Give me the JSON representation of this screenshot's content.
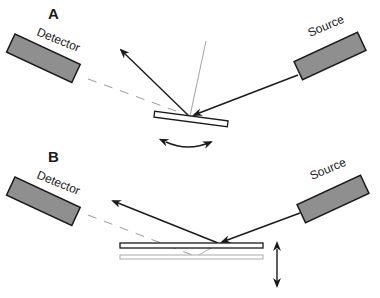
{
  "panels": [
    {
      "id": "A",
      "label": "A",
      "detector_label": "Detector",
      "source_label": "Source",
      "sample_motion": "rotation"
    },
    {
      "id": "B",
      "label": "B",
      "detector_label": "Detector",
      "source_label": "Source",
      "sample_motion": "vertical translation"
    }
  ],
  "colors": {
    "device_fill": "#8f8f8f",
    "stroke": "#1a1a1a",
    "dashed_beam": "#9a9a9a",
    "normal_line": "#8a8a8a",
    "background": "#ffffff"
  }
}
